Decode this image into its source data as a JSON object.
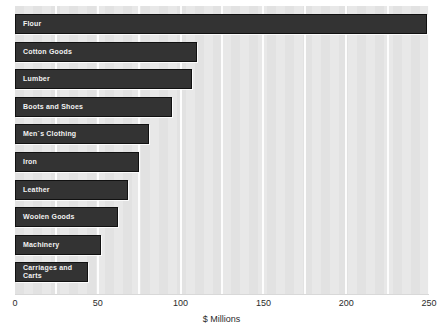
{
  "chart_data": {
    "type": "bar",
    "orientation": "horizontal",
    "title": "",
    "xlabel": "$ Millions",
    "ylabel": "",
    "xlim": [
      0,
      250
    ],
    "xticks": [
      0,
      50,
      100,
      150,
      200,
      250
    ],
    "xtick_labels": [
      "0",
      "50",
      "100",
      "150",
      "200",
      "250"
    ],
    "gridlines": {
      "visible": true,
      "axis": "x",
      "interval": 25,
      "color": "#fdfdfd"
    },
    "legend": {
      "visible": false
    },
    "categories": [
      "Flour",
      "Cotton Goods",
      "Lumber",
      "Boots and Shoes",
      "Men`s Clothing",
      "Iron",
      "Leather",
      "Woolen Goods",
      "Machinery",
      "Carriages and\nCarts"
    ],
    "values": [
      249,
      110,
      107,
      95,
      81,
      75,
      68,
      62,
      52,
      44
    ],
    "bar_color": "#333333",
    "bar_label_color": "#f2f2f2",
    "plot_background": "#e2e2e2",
    "figure_background": "#ffffff"
  }
}
